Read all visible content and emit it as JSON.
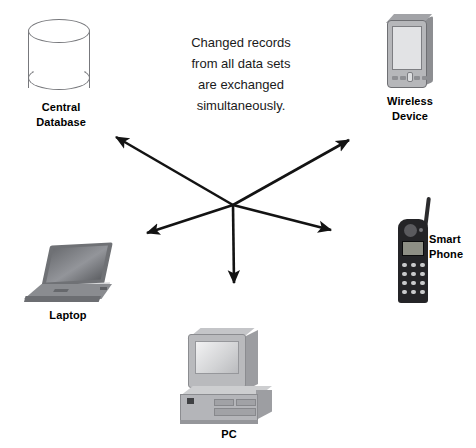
{
  "diagram": {
    "width": 476,
    "height": 448,
    "background_color": "#ffffff",
    "center_note": "Changed records\nfrom all data sets\nare exchanged\nsimultaneously.",
    "hub": {
      "x": 233,
      "y": 205
    },
    "arrow_color": "#131313",
    "nodes": [
      {
        "id": "central-database",
        "label": "Central\nDatabase",
        "icon": "database-cylinder-icon",
        "label_x": 61,
        "label_y": 100
      },
      {
        "id": "wireless-device",
        "label": "Wireless\nDevice",
        "icon": "pda-device-icon",
        "label_x": 410,
        "label_y": 94
      },
      {
        "id": "smart-phone",
        "label": "Smart\nPhone",
        "icon": "mobile-phone-icon",
        "label_x": 447,
        "label_y": 232
      },
      {
        "id": "laptop",
        "label": "Laptop",
        "icon": "laptop-computer-icon",
        "label_x": 68,
        "label_y": 308
      },
      {
        "id": "pc",
        "label": "PC",
        "icon": "desktop-computer-icon",
        "label_x": 229,
        "label_y": 427
      }
    ],
    "arrows": [
      {
        "id": "arrow-to-central-database",
        "target": "central-database",
        "from_x": 233,
        "from_y": 205,
        "to_x": 113,
        "to_y": 135
      },
      {
        "id": "arrow-to-wireless-device",
        "target": "wireless-device",
        "from_x": 233,
        "from_y": 205,
        "to_x": 352,
        "to_y": 138
      },
      {
        "id": "arrow-to-laptop",
        "target": "laptop",
        "from_x": 233,
        "from_y": 205,
        "to_x": 143,
        "to_y": 235
      },
      {
        "id": "arrow-to-smart-phone",
        "target": "smart-phone",
        "from_x": 233,
        "from_y": 205,
        "to_x": 335,
        "to_y": 232
      },
      {
        "id": "arrow-to-pc",
        "target": "pc",
        "from_x": 233,
        "from_y": 205,
        "to_x": 234,
        "to_y": 288
      }
    ]
  }
}
